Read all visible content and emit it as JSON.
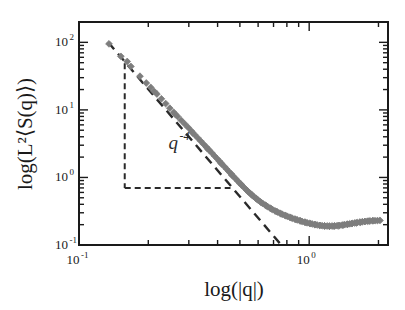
{
  "chart_data": {
    "type": "scatter",
    "title": "",
    "xlabel": "log(|q|)",
    "ylabel": "log(L²⟨S(q)⟩)",
    "xscale": "log",
    "yscale": "log",
    "xlim": [
      0.1,
      2.2
    ],
    "ylim": [
      0.1,
      200
    ],
    "grid": false,
    "legend": null,
    "x_ticks": [
      {
        "value": 0.1,
        "label": "10",
        "exponent": "-1"
      },
      {
        "value": 1.0,
        "label": "10",
        "exponent": "0"
      }
    ],
    "y_ticks": [
      {
        "value": 0.1,
        "label": "10",
        "exponent": "-1"
      },
      {
        "value": 1.0,
        "label": "10",
        "exponent": "0"
      },
      {
        "value": 10.0,
        "label": "10",
        "exponent": "1"
      },
      {
        "value": 100.0,
        "label": "10",
        "exponent": "2"
      }
    ],
    "marker": {
      "shape": "diamond",
      "color": "#7d7d7d",
      "size": 3.4
    },
    "series": [
      {
        "name": "L²⟨S(q)⟩",
        "points": [
          [
            0.135,
            95.0
          ],
          [
            0.152,
            62.0
          ],
          [
            0.168,
            44.0
          ],
          [
            0.184,
            31.5
          ],
          [
            0.196,
            25.0
          ],
          [
            0.205,
            21.5
          ],
          [
            0.218,
            17.2
          ],
          [
            0.228,
            14.6
          ],
          [
            0.238,
            12.4
          ],
          [
            0.248,
            10.6
          ],
          [
            0.258,
            9.2
          ],
          [
            0.268,
            8.0
          ],
          [
            0.278,
            7.0
          ],
          [
            0.288,
            6.2
          ],
          [
            0.298,
            5.5
          ],
          [
            0.308,
            4.85
          ],
          [
            0.318,
            4.3
          ],
          [
            0.328,
            3.85
          ],
          [
            0.338,
            3.45
          ],
          [
            0.348,
            3.1
          ],
          [
            0.358,
            2.8
          ],
          [
            0.368,
            2.53
          ],
          [
            0.378,
            2.3
          ],
          [
            0.388,
            2.08
          ],
          [
            0.398,
            1.9
          ],
          [
            0.408,
            1.73
          ],
          [
            0.418,
            1.58
          ],
          [
            0.428,
            1.45
          ],
          [
            0.438,
            1.33
          ],
          [
            0.448,
            1.22
          ],
          [
            0.458,
            1.13
          ],
          [
            0.468,
            1.04
          ],
          [
            0.478,
            0.965
          ],
          [
            0.488,
            0.895
          ],
          [
            0.498,
            0.832
          ],
          [
            0.51,
            0.765
          ],
          [
            0.522,
            0.706
          ],
          [
            0.534,
            0.654
          ],
          [
            0.546,
            0.608
          ],
          [
            0.558,
            0.568
          ],
          [
            0.572,
            0.527
          ],
          [
            0.586,
            0.492
          ],
          [
            0.6,
            0.462
          ],
          [
            0.614,
            0.436
          ],
          [
            0.628,
            0.412
          ],
          [
            0.644,
            0.39
          ],
          [
            0.66,
            0.37
          ],
          [
            0.676,
            0.352
          ],
          [
            0.692,
            0.336
          ],
          [
            0.71,
            0.321
          ],
          [
            0.728,
            0.308
          ],
          [
            0.746,
            0.296
          ],
          [
            0.764,
            0.285
          ],
          [
            0.784,
            0.275
          ],
          [
            0.804,
            0.266
          ],
          [
            0.824,
            0.257
          ],
          [
            0.844,
            0.249
          ],
          [
            0.866,
            0.242
          ],
          [
            0.888,
            0.235
          ],
          [
            0.91,
            0.229
          ],
          [
            0.932,
            0.223
          ],
          [
            0.956,
            0.218
          ],
          [
            0.98,
            0.213
          ],
          [
            1.004,
            0.209
          ],
          [
            1.03,
            0.205
          ],
          [
            1.056,
            0.201
          ],
          [
            1.082,
            0.198
          ],
          [
            1.11,
            0.195
          ],
          [
            1.138,
            0.193
          ],
          [
            1.166,
            0.192
          ],
          [
            1.196,
            0.191
          ],
          [
            1.226,
            0.19
          ],
          [
            1.258,
            0.191
          ],
          [
            1.29,
            0.192
          ],
          [
            1.322,
            0.193
          ],
          [
            1.356,
            0.195
          ],
          [
            1.39,
            0.197
          ],
          [
            1.426,
            0.2
          ],
          [
            1.462,
            0.203
          ],
          [
            1.5,
            0.206
          ],
          [
            1.538,
            0.209
          ],
          [
            1.578,
            0.212
          ],
          [
            1.618,
            0.215
          ],
          [
            1.66,
            0.218
          ],
          [
            1.702,
            0.221
          ],
          [
            1.746,
            0.223
          ],
          [
            1.79,
            0.225
          ],
          [
            1.836,
            0.227
          ],
          [
            1.884,
            0.228
          ],
          [
            1.932,
            0.229
          ],
          [
            1.98,
            0.23
          ],
          [
            2.03,
            0.231
          ],
          [
            0.162,
            52.0
          ],
          [
            0.212,
            18.8
          ],
          [
            0.262,
            8.6
          ],
          [
            0.312,
            4.55
          ],
          [
            0.362,
            2.66
          ],
          [
            0.412,
            1.65
          ],
          [
            0.462,
            1.08
          ],
          [
            0.505,
            0.795
          ],
          [
            0.54,
            0.63
          ],
          [
            0.565,
            0.548
          ],
          [
            0.592,
            0.48
          ],
          [
            0.62,
            0.424
          ],
          [
            0.652,
            0.38
          ],
          [
            0.684,
            0.344
          ],
          [
            0.718,
            0.314
          ],
          [
            0.754,
            0.29
          ],
          [
            0.792,
            0.271
          ],
          [
            0.832,
            0.254
          ],
          [
            0.874,
            0.239
          ],
          [
            0.918,
            0.227
          ],
          [
            0.964,
            0.216
          ],
          [
            1.012,
            0.207
          ],
          [
            1.062,
            0.2
          ],
          [
            1.114,
            0.195
          ],
          [
            1.168,
            0.191
          ],
          [
            1.224,
            0.189
          ],
          [
            1.282,
            0.19
          ],
          [
            1.342,
            0.193
          ],
          [
            1.404,
            0.197
          ],
          [
            1.468,
            0.202
          ],
          [
            1.534,
            0.207
          ],
          [
            1.602,
            0.212
          ],
          [
            1.672,
            0.217
          ],
          [
            1.744,
            0.222
          ],
          [
            1.818,
            0.226
          ],
          [
            1.894,
            0.229
          ]
        ]
      }
    ],
    "fit_line": {
      "name": "power-law guide",
      "style": "dashed",
      "color": "#2a2a2a",
      "slope": -4,
      "x_start": 0.134,
      "y_start": 100.0,
      "x_end": 0.76,
      "y_end": 0.098
    },
    "annotations": [
      {
        "name": "slope-triangle",
        "style": "dashed",
        "color": "#2a2a2a",
        "apex_x": 0.158,
        "apex_y": 49.0,
        "corner_x": 0.158,
        "corner_y": 0.7,
        "base_end_x": 0.455,
        "base_end_y": 0.7
      },
      {
        "name": "exponent-label",
        "base": "q",
        "exponent": "-4",
        "x": 0.245,
        "y": 2.6
      }
    ]
  }
}
